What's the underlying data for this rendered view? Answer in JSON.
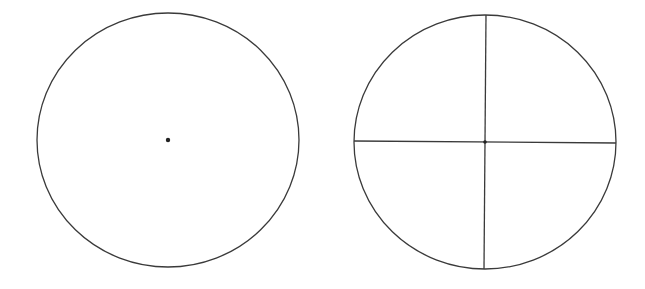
{
  "diagram": {
    "background": "#ffffff",
    "stroke_color": "#3a3a3a",
    "stroke_width": 1.3,
    "figures": [
      {
        "name": "circle-with-center-point",
        "cx": 168,
        "cy": 140,
        "rx": 131,
        "ry": 127,
        "center_dot": {
          "cx": 168,
          "cy": 140,
          "r": 2.2
        }
      },
      {
        "name": "circle-divided-into-quarters",
        "cx": 485,
        "cy": 142,
        "rx": 131,
        "ry": 127,
        "center_dot": {
          "cx": 485,
          "cy": 142,
          "r": 1.8
        },
        "diameters": [
          {
            "x1": 354,
            "y1": 141,
            "x2": 616,
            "y2": 143
          },
          {
            "x1": 486,
            "y1": 15,
            "x2": 484,
            "y2": 269
          }
        ]
      }
    ]
  }
}
